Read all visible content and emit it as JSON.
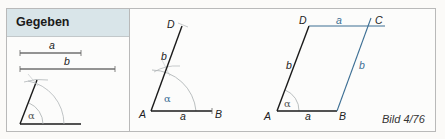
{
  "header": {
    "title": "Gegeben"
  },
  "caption": "Bild 4/76",
  "colors": {
    "header_bg": "#d9e5e9",
    "frame_border": "#b9b9b9",
    "line_black": "#1a1a1a",
    "line_blue": "#3d6f94",
    "arc_gray": "#a8aeb0"
  },
  "given": {
    "segment_a_label": "a",
    "segment_b_label": "b",
    "angle_label": "α"
  },
  "step1": {
    "vertex_A": "A",
    "vertex_B": "B",
    "vertex_D": "D",
    "side_a_label": "a",
    "side_b_label": "b",
    "angle_label": "α"
  },
  "step2": {
    "vertex_A": "A",
    "vertex_B": "B",
    "vertex_C": "C",
    "vertex_D": "D",
    "side_AB_label": "a",
    "side_AD_label": "b",
    "side_DC_label": "a",
    "side_BC_label": "b",
    "angle_label": "α"
  }
}
